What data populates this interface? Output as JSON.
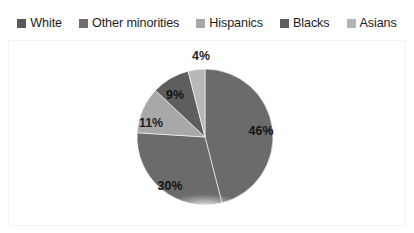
{
  "legend": {
    "position": "top",
    "items": [
      {
        "label": "White",
        "marker": "square-swatch-icon",
        "color": "#595959"
      },
      {
        "label": "Other minorities",
        "marker": "square-swatch-icon",
        "color": "#6e6e6e"
      },
      {
        "label": "Hispanics",
        "marker": "square-swatch-icon",
        "color": "#a6a6a6"
      },
      {
        "label": "Blacks",
        "marker": "square-swatch-icon",
        "color": "#5e5e5e"
      },
      {
        "label": "Asians",
        "marker": "square-swatch-icon",
        "color": "#b4b4b4"
      }
    ]
  },
  "chart_data": {
    "type": "pie",
    "title": "",
    "subtitle": "",
    "xlabel": "",
    "ylabel": "",
    "grid": false,
    "legend_position": "top",
    "start_angle_deg": 0,
    "direction": "clockwise",
    "categories": [
      "White",
      "Other minorities",
      "Hispanics",
      "Blacks",
      "Asians"
    ],
    "values": [
      46,
      30,
      11,
      9,
      4
    ],
    "value_unit": "%",
    "data_labels": [
      "46%",
      "30%",
      "11%",
      "9%",
      "4%"
    ],
    "colors": [
      "#6b6b6b",
      "#6b6b6b",
      "#a8a8a8",
      "#5e5e5e",
      "#b8b8b8"
    ],
    "slices": [
      {
        "name": "White",
        "value": 46,
        "label": "46%",
        "color": "#6b6b6b",
        "label_x": 261,
        "label_y": 131,
        "label_inside": true
      },
      {
        "name": "Other minorities",
        "value": 30,
        "label": "30%",
        "color": "#6b6b6b",
        "label_x": 170,
        "label_y": 186,
        "label_inside": true
      },
      {
        "name": "Hispanics",
        "value": 11,
        "label": "11%",
        "color": "#a8a8a8",
        "label_x": 151,
        "label_y": 123,
        "label_inside": true
      },
      {
        "name": "Blacks",
        "value": 9,
        "label": "9%",
        "color": "#5e5e5e",
        "label_x": 175,
        "label_y": 95,
        "label_inside": true
      },
      {
        "name": "Asians",
        "value": 4,
        "label": "4%",
        "color": "#b8b8b8",
        "label_x": 201,
        "label_y": 56,
        "label_inside": false
      }
    ],
    "geometry": {
      "center_x": 205,
      "center_y": 137,
      "radius": 68
    }
  }
}
